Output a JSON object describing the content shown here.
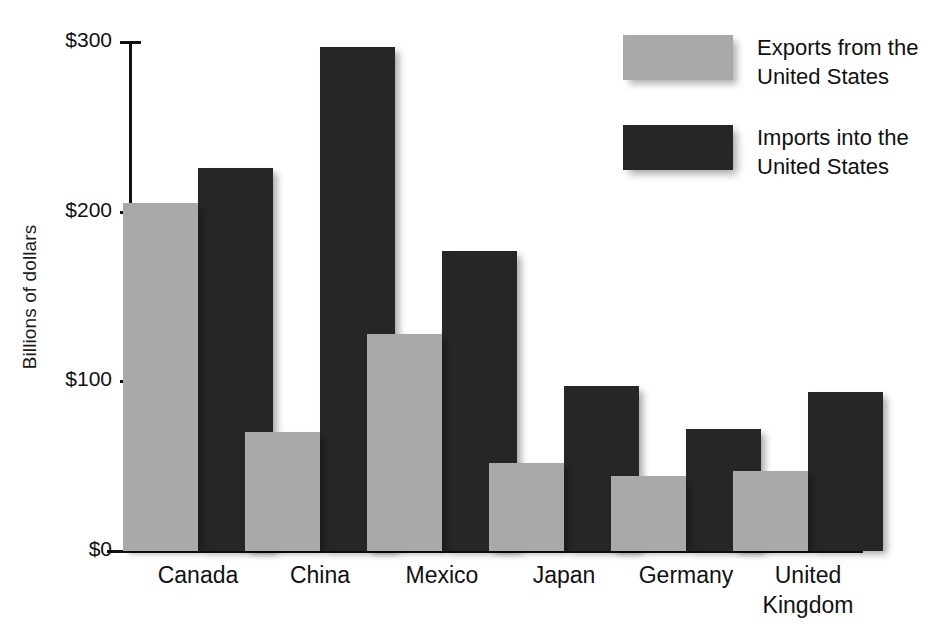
{
  "chart_data": {
    "type": "bar",
    "title": "",
    "xlabel": "",
    "ylabel": "Billions of dollars",
    "ylim": [
      0,
      300
    ],
    "ytick_values": [
      0,
      100,
      200,
      300
    ],
    "ytick_labels": [
      "$0",
      "$100",
      "$200",
      "$300"
    ],
    "grid": false,
    "legend_position": "top-right",
    "categories": [
      "Canada",
      "China",
      "Mexico",
      "Japan",
      "Germany",
      "United\nKingdom"
    ],
    "series": [
      {
        "name": "Exports from the\nUnited States",
        "color": "#a9a9a9",
        "values": [
          205,
          70,
          128,
          52,
          44,
          47
        ]
      },
      {
        "name": "Imports into the\nUnited States",
        "color": "#262626",
        "values": [
          226,
          297,
          177,
          97,
          72,
          94
        ]
      }
    ]
  },
  "axis": {
    "y_label": "Billions of dollars"
  },
  "legend": {
    "items": [
      {
        "label": "Exports from the\nUnited States",
        "color": "#a9a9a9"
      },
      {
        "label": "Imports into the\nUnited States",
        "color": "#262626"
      }
    ]
  }
}
